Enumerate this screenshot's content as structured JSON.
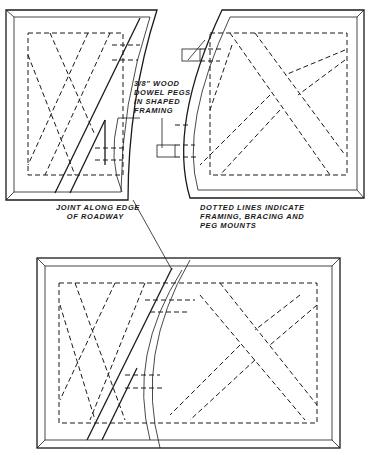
{
  "figure": {
    "type": "technical-drawing",
    "panels": [
      {
        "name": "top-left-module",
        "description": "Left baseboard section with shaped curved edge"
      },
      {
        "name": "top-right-module",
        "description": "Right baseboard section with concave curved edge"
      },
      {
        "name": "bottom-assembled",
        "description": "Both sections joined along roadway edge"
      }
    ],
    "labels": {
      "dowel_pegs": "3/8\" WOOD\nDOWEL PEGS\nIN SHAPED\nFRAMING",
      "joint": "JOINT ALONG EDGE\n    OF ROADWAY",
      "dotted_lines": "DOTTED LINES INDICATE\nFRAMING, BRACING AND\nPEG MOUNTS"
    },
    "colors": {
      "ink": "#1a1a1a",
      "paper": "#ffffff"
    }
  }
}
